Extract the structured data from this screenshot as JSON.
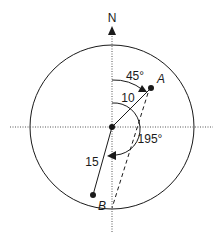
{
  "diagram": {
    "type": "vector-bearing-diagram",
    "north_label": "N",
    "points": {
      "A": {
        "label": "A",
        "distance": "10",
        "bearing": "45°"
      },
      "B": {
        "label": "B",
        "distance": "15",
        "bearing": "195°"
      }
    },
    "labels": {
      "angle_a": "45°",
      "distance_a": "10",
      "angle_b": "195°",
      "distance_b": "15",
      "point_a": "A",
      "point_b": "B",
      "north": "N"
    },
    "colors": {
      "stroke": "#1a1a1a",
      "background": "#ffffff",
      "axis": "#555555"
    }
  }
}
